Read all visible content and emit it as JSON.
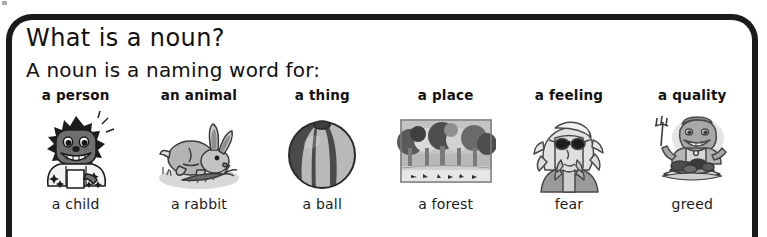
{
  "frame": {
    "border_color": "#1b1b1b",
    "background": "#ffffff"
  },
  "heading": {
    "title": "What is a noun?",
    "subtitle": "A noun is a naming word for:"
  },
  "columns": [
    {
      "category": "a person",
      "caption": "a child",
      "illustration": "child-illustration",
      "colors": {
        "skin": "#6f6f6f",
        "hair": "#1c1c1c",
        "shirt": "#f2f2f2",
        "teeth": "#ffffff"
      }
    },
    {
      "category": "an animal",
      "caption": "a rabbit",
      "illustration": "rabbit-illustration",
      "colors": {
        "body": "#b4b4b4",
        "carrot": "#6d6d6d",
        "ground": "#d8d8d8"
      }
    },
    {
      "category": "a thing",
      "caption": "a ball",
      "illustration": "ball-illustration",
      "colors": {
        "dark_panel": "#4a4a4a",
        "light_panel": "#b9b9b9",
        "outline": "#2a2a2a"
      }
    },
    {
      "category": "a place",
      "caption": "a forest",
      "illustration": "forest-illustration",
      "colors": {
        "sky": "#b8b8b8",
        "foliage_dark": "#4e4e4e",
        "foliage_light": "#dadada",
        "ground": "#cfcfcf"
      }
    },
    {
      "category": "a feeling",
      "caption": "fear",
      "illustration": "fear-illustration",
      "colors": {
        "hair": "#e2e2e2",
        "glasses": "#1d1d1d",
        "coat": "#9a9a9a"
      }
    },
    {
      "category": "a quality",
      "caption": "greed",
      "illustration": "greed-illustration",
      "colors": {
        "body": "#a8a8a8",
        "food": "#4d4d4d",
        "plate": "#dcdcdc"
      }
    }
  ]
}
